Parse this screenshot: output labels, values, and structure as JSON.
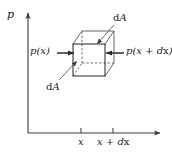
{
  "figure": {
    "type": "physics-diagram",
    "line_color": "#3a3a3a",
    "text_color": "#1a1a1a",
    "background": "#ffffff"
  },
  "axes": {
    "y_axis_label": "p",
    "x_axis_label": "",
    "ticks": [
      {
        "label": "x",
        "x": 81
      },
      {
        "label": "x + dx",
        "x": 113
      }
    ],
    "tick_text_x": "x",
    "tick_text_xdx": "x + d",
    "tick_text_xdx_var": "x"
  },
  "annotations": {
    "pressure_left": "p(x)",
    "pressure_right_prefix": "p(x + d",
    "pressure_right_var": "x",
    "pressure_right_suffix": ")",
    "area_top": "d",
    "area_top_var": "A",
    "area_bottom": "d",
    "area_bottom_var": "A"
  },
  "cube": {
    "front_left": 73,
    "front_top": 44,
    "front_right": 105,
    "front_bottom": 76,
    "depth_dx": 9,
    "depth_dy": -13
  }
}
